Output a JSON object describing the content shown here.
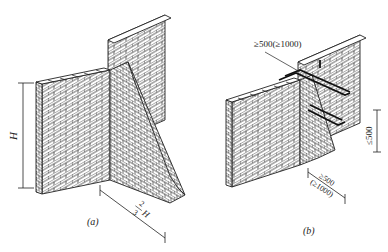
{
  "figure_a": {
    "caption": "(a)",
    "height_label": "H",
    "offset_label_num": "2",
    "offset_label_den": "3",
    "offset_label_var": "H"
  },
  "figure_b": {
    "caption": "(b)",
    "top_dim": "≥500(≥1000)",
    "vertical_dim": "≤500",
    "bottom_dim_1": "≥500",
    "bottom_dim_2": "(≥1000)"
  },
  "colors": {
    "line": "#222222",
    "background": "#ffffff"
  }
}
